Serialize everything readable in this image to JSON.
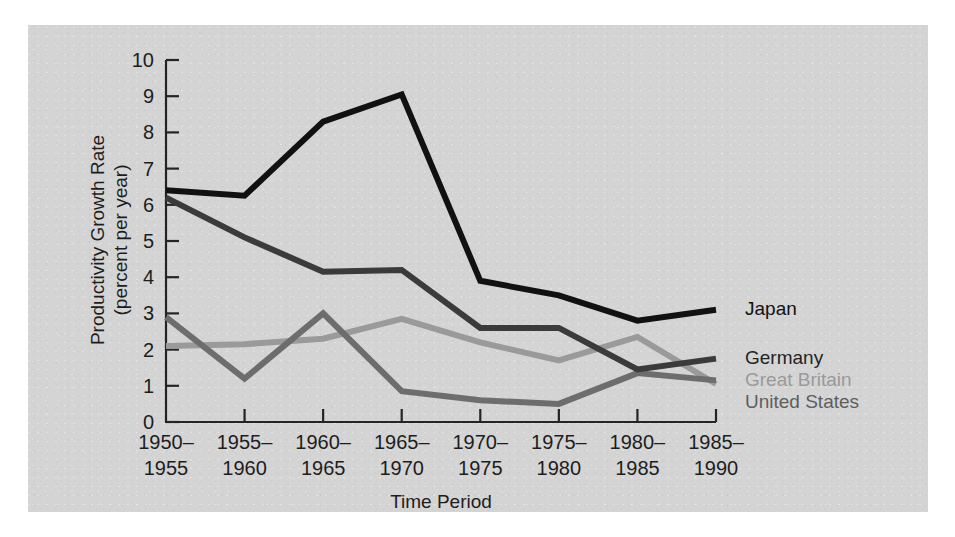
{
  "chart_data": {
    "type": "line",
    "title": "",
    "xlabel": "Time Period",
    "ylabel": "Productivity Growth Rate\n(percent per year)",
    "ylabel_line1": "Productivity Growth Rate",
    "ylabel_line2": "(percent per year)",
    "categories": [
      "1950–\n1955",
      "1955–\n1960",
      "1960–\n1965",
      "1965–\n1970",
      "1970–\n1975",
      "1975–\n1980",
      "1980–\n1985",
      "1985–\n1990"
    ],
    "category_lines": [
      [
        "1950–",
        "1955"
      ],
      [
        "1955–",
        "1960"
      ],
      [
        "1960–",
        "1965"
      ],
      [
        "1965–",
        "1970"
      ],
      [
        "1970–",
        "1975"
      ],
      [
        "1975–",
        "1980"
      ],
      [
        "1980–",
        "1985"
      ],
      [
        "1985–",
        "1990"
      ]
    ],
    "ylim": [
      0,
      10
    ],
    "yticks": [
      0,
      1,
      2,
      3,
      4,
      5,
      6,
      7,
      8,
      9,
      10
    ],
    "ytick_labels": [
      "0",
      "1",
      "2",
      "3",
      "4",
      "5",
      "6",
      "7",
      "8",
      "9",
      "10"
    ],
    "grid": false,
    "legend_position": "line-end-labels",
    "series": [
      {
        "name": "Japan",
        "color": "#111111",
        "width": 6.0,
        "values": [
          6.4,
          6.25,
          8.3,
          9.05,
          3.9,
          3.5,
          2.8,
          3.1
        ]
      },
      {
        "name": "Germany",
        "color": "#3b3b3b",
        "width": 6.0,
        "values": [
          6.2,
          5.1,
          4.15,
          4.2,
          2.6,
          2.6,
          1.45,
          1.75
        ]
      },
      {
        "name": "Great Britain",
        "color": "#9a9a9a",
        "width": 6.0,
        "values": [
          2.1,
          2.15,
          2.3,
          2.85,
          2.2,
          1.7,
          2.35,
          1.05
        ]
      },
      {
        "name": "United States",
        "color": "#6d6d6d",
        "width": 6.0,
        "values": [
          2.9,
          1.2,
          3.0,
          0.85,
          0.6,
          0.5,
          1.35,
          1.15
        ]
      }
    ],
    "series_labels": [
      {
        "text": "Japan",
        "color": "#111111",
        "x": 745,
        "y": 310
      },
      {
        "text": "Germany",
        "color": "#242424",
        "x": 745,
        "y": 359
      },
      {
        "text": "Great Britain",
        "color": "#9a9a9a",
        "x": 745,
        "y": 381
      },
      {
        "text": "United States",
        "color": "#5e5e5e",
        "x": 745,
        "y": 403
      }
    ]
  },
  "figure": {
    "background_color": "#ffffff",
    "panel_color": "#d4d4d4",
    "axis_color": "#242424"
  }
}
